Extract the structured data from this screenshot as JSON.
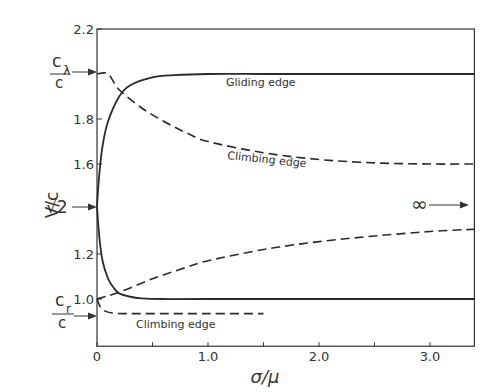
{
  "chart_data": {
    "type": "line",
    "title": "",
    "xlabel": "σ/μ",
    "ylabel": "V/c",
    "xlim": [
      0,
      3.4
    ],
    "ylim": [
      0.79,
      2.2
    ],
    "grid": false,
    "x_ticks": [
      0,
      0.5,
      1.0,
      1.5,
      2.0,
      2.5,
      3.0
    ],
    "x_tick_labels": [
      "0",
      "",
      "1.0",
      "",
      "2.0",
      "",
      "3.0"
    ],
    "y_ticks": [
      1.0,
      1.2,
      1.6,
      1.8,
      2.2
    ],
    "y_tick_labels": [
      "1.0",
      "1.2",
      "1.6",
      "1.8",
      "2.2"
    ],
    "side_markers": [
      {
        "label": "cλ/c",
        "value": 2.0
      },
      {
        "label": "√2",
        "value": 1.414
      },
      {
        "label": "cr/c",
        "value": 0.955
      }
    ],
    "annotations": [
      {
        "text": "Gliding edge",
        "x": 1.35,
        "y": 1.96
      },
      {
        "text": "Climbing edge",
        "x": 1.3,
        "y": 1.66
      },
      {
        "text": "Climbing edge",
        "x": 0.25,
        "y": 0.89
      },
      {
        "text": "∞ →",
        "x": 3.2,
        "y": 1.42
      }
    ],
    "series": [
      {
        "name": "Gliding edge (upper branch)",
        "style": "solid",
        "x": [
          0,
          0.02,
          0.05,
          0.1,
          0.2,
          0.3,
          0.5,
          0.7,
          1.0,
          1.5,
          2.0,
          3.0,
          3.4
        ],
        "y": [
          1.414,
          1.55,
          1.68,
          1.79,
          1.9,
          1.95,
          1.985,
          1.995,
          2.0,
          2.0,
          2.0,
          2.0,
          2.0
        ]
      },
      {
        "name": "Gliding edge (lower branch)",
        "style": "solid",
        "x": [
          0,
          0.02,
          0.05,
          0.1,
          0.15,
          0.2,
          0.3,
          0.4,
          0.6,
          1.0,
          2.0,
          3.4
        ],
        "y": [
          1.414,
          1.28,
          1.17,
          1.09,
          1.05,
          1.025,
          1.01,
          1.003,
          1.0,
          1.0,
          1.0,
          1.0
        ]
      },
      {
        "name": "Climbing edge (upper branch)",
        "style": "dashed",
        "x": [
          0,
          0.1,
          0.2,
          0.4,
          0.6,
          0.8,
          1.0,
          1.5,
          2.0,
          2.5,
          3.0,
          3.4
        ],
        "y": [
          2.0,
          2.0,
          1.93,
          1.85,
          1.79,
          1.74,
          1.7,
          1.65,
          1.62,
          1.605,
          1.6,
          1.6
        ]
      },
      {
        "name": "Climbing edge (rising branch)",
        "style": "dashed",
        "x": [
          0,
          0.2,
          0.5,
          0.8,
          1.0,
          1.5,
          2.0,
          2.5,
          3.0,
          3.4
        ],
        "y": [
          1.0,
          1.03,
          1.09,
          1.14,
          1.17,
          1.22,
          1.255,
          1.28,
          1.3,
          1.31
        ]
      },
      {
        "name": "Climbing edge (lower branch)",
        "style": "dashed",
        "x": [
          0,
          0.03,
          0.08,
          0.15,
          0.25,
          0.5,
          1.0,
          1.5
        ],
        "y": [
          1.0,
          0.965,
          0.945,
          0.937,
          0.935,
          0.935,
          0.935,
          0.935
        ]
      }
    ]
  },
  "labels": {
    "ylabel": "V/c",
    "xlabel": "σ/μ",
    "marker_cl_num": "c",
    "marker_cl_sub": "λ",
    "marker_cl_den": "c",
    "marker_sqrt2": "√2",
    "marker_cr_num": "c",
    "marker_cr_sub": "r",
    "marker_cr_den": "c",
    "gliding": "Gliding edge",
    "climbing_upper": "Climbing edge",
    "climbing_lower": "Climbing edge",
    "infinity": "∞"
  }
}
